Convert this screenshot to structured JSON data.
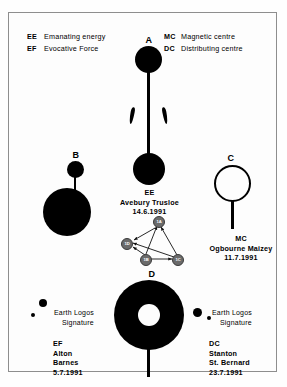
{
  "legend": {
    "left": [
      {
        "code": "EE",
        "desc": "Emanating energy"
      },
      {
        "code": "EF",
        "desc": "Evocative Force"
      }
    ],
    "right": [
      {
        "code": "MC",
        "desc": "Magnetic centre"
      },
      {
        "code": "DC",
        "desc": "Distributing centre"
      }
    ]
  },
  "figures": {
    "a": {
      "letter": "A"
    },
    "b": {
      "letter": "B"
    },
    "c": {
      "letter": "C"
    },
    "d": {
      "letter": "D"
    }
  },
  "captions": {
    "ee": {
      "code": "EE",
      "place": "Avebury Trusloe",
      "date": "14.6.1991"
    },
    "mc": {
      "code": "MC",
      "place": "Ogbourne Maizey",
      "date": "11.7.1991"
    },
    "ef": {
      "code": "EF",
      "place1": "Alton",
      "place2": "Barnes",
      "date": "5.7.1991"
    },
    "dc": {
      "code": "DC",
      "place1": "Stanton",
      "place2": "St. Bernard",
      "date": "23.7.1991"
    }
  },
  "earth_logos": {
    "left": {
      "line1": "Earth Logos",
      "line2": "Signature"
    },
    "right": {
      "line1": "Earth Logos",
      "line2": "Signature"
    }
  },
  "cluster": {
    "nodes": [
      {
        "id": "1A",
        "label": "1A"
      },
      {
        "id": "1D",
        "label": "1D"
      },
      {
        "id": "1B",
        "label": "1B"
      },
      {
        "id": "1C",
        "label": "1C"
      }
    ]
  },
  "colors": {
    "ink": "#000000",
    "paper": "#fdfdfd",
    "frame": "#8e8e8e",
    "node_fill": "#6b6b6b",
    "node_stroke": "#3a3a3a"
  }
}
